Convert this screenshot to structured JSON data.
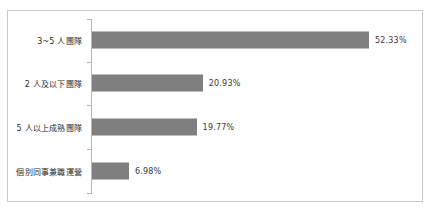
{
  "chart_data": {
    "type": "bar",
    "orientation": "horizontal",
    "title": "",
    "xlabel": "",
    "ylabel": "",
    "grid": false,
    "legend": null,
    "xlim": [
      0,
      60
    ],
    "axis_color": "#b5b5b5",
    "bar_color": "#7f7f7f",
    "border_color": "#c9c9c9",
    "value_suffix": "%",
    "categories": [
      "3~5 人團隊",
      "2 人及以下團隊",
      "5 人以上成熟團隊",
      "個別同事兼職運營"
    ],
    "values": [
      52.33,
      20.93,
      19.77,
      6.98
    ],
    "value_labels": [
      "52.33%",
      "20.93%",
      "19.77%",
      "6.98%"
    ],
    "bars": [
      {
        "label": "3~5 人團隊",
        "value": 52.33,
        "value_label": "52.33%"
      },
      {
        "label": "2 人及以下團隊",
        "value": 20.93,
        "value_label": "20.93%"
      },
      {
        "label": "5 人以上成熟團隊",
        "value": 19.77,
        "value_label": "19.77%"
      },
      {
        "label": "個別同事兼職運營",
        "value": 6.98,
        "value_label": "6.98%"
      }
    ]
  }
}
